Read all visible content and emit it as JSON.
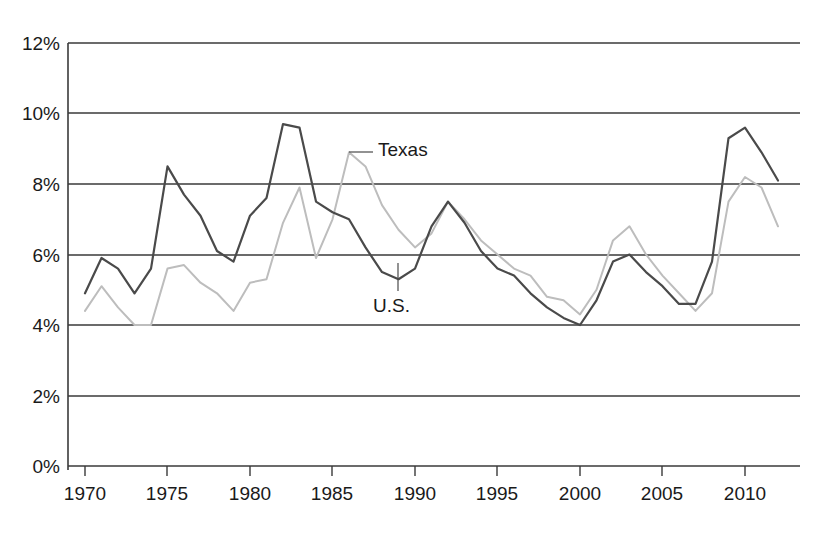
{
  "chart_data": {
    "type": "line",
    "title": "",
    "xlabel": "",
    "ylabel": "",
    "xlim": [
      1970,
      2012
    ],
    "ylim": [
      0,
      12
    ],
    "grid": true,
    "y_tick_labels": [
      "0%",
      "2%",
      "4%",
      "6%",
      "8%",
      "10%",
      "12%"
    ],
    "y_tick_values": [
      0,
      2,
      4,
      6,
      8,
      10,
      12
    ],
    "x_tick_labels": [
      "1970",
      "1975",
      "1980",
      "1985",
      "1990",
      "1995",
      "2000",
      "2005",
      "2010"
    ],
    "x_tick_values": [
      1970,
      1975,
      1980,
      1985,
      1990,
      1995,
      2000,
      2005,
      2010
    ],
    "x": [
      1970,
      1971,
      1972,
      1973,
      1974,
      1975,
      1976,
      1977,
      1978,
      1979,
      1980,
      1981,
      1982,
      1983,
      1984,
      1985,
      1986,
      1987,
      1988,
      1989,
      1990,
      1991,
      1992,
      1993,
      1994,
      1995,
      1996,
      1997,
      1998,
      1999,
      2000,
      2001,
      2002,
      2003,
      2004,
      2005,
      2006,
      2007,
      2008,
      2009,
      2010,
      2011,
      2012
    ],
    "legend_position": "inline-annotations",
    "series": [
      {
        "name": "U.S.",
        "color": "#4a4a4a",
        "label_annotation": "U.S.",
        "values": [
          4.9,
          5.9,
          5.6,
          4.9,
          5.6,
          8.5,
          7.7,
          7.1,
          6.1,
          5.8,
          7.1,
          7.6,
          9.7,
          9.6,
          7.5,
          7.2,
          7.0,
          6.2,
          5.5,
          5.3,
          5.6,
          6.8,
          7.5,
          6.9,
          6.1,
          5.6,
          5.4,
          4.9,
          4.5,
          4.2,
          4.0,
          4.7,
          5.8,
          6.0,
          5.5,
          5.1,
          4.6,
          4.6,
          5.8,
          9.3,
          9.6,
          8.9,
          8.1
        ]
      },
      {
        "name": "Texas",
        "color": "#bdbdbd",
        "label_annotation": "Texas",
        "values": [
          4.4,
          5.1,
          4.5,
          4.0,
          4.0,
          5.6,
          5.7,
          5.2,
          4.9,
          4.4,
          5.2,
          5.3,
          6.9,
          7.9,
          5.9,
          7.0,
          8.9,
          8.5,
          7.4,
          6.7,
          6.2,
          6.6,
          7.5,
          7.0,
          6.4,
          6.0,
          5.6,
          5.4,
          4.8,
          4.7,
          4.3,
          5.0,
          6.4,
          6.8,
          6.0,
          5.4,
          4.9,
          4.4,
          4.9,
          7.5,
          8.2,
          7.9,
          6.8
        ]
      }
    ],
    "annotations": [
      {
        "text": "Texas",
        "points_to_series": "Texas",
        "points_to_x": 1986,
        "points_to_y": 8.9
      },
      {
        "text": "U.S.",
        "points_to_series": "U.S.",
        "points_to_x": 1989,
        "points_to_y": 5.3
      }
    ]
  },
  "axis": {
    "y_labels": [
      "12%",
      "10%",
      "8%",
      "6%",
      "4%",
      "2%",
      "0%"
    ],
    "x_labels": [
      "1970",
      "1975",
      "1980",
      "1985",
      "1990",
      "1995",
      "2000",
      "2005",
      "2010"
    ]
  },
  "labels": {
    "texas": "Texas",
    "us": "U.S."
  }
}
